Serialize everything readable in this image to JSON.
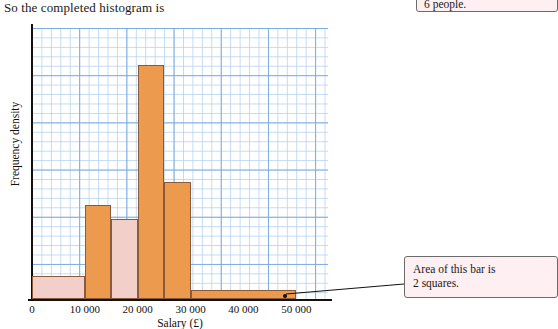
{
  "caption": "So the completed histogram is",
  "note_top": {
    "text": "6 people."
  },
  "note_area": {
    "line1": "Area of this bar is",
    "line2": "2 squares."
  },
  "chart_data": {
    "type": "bar",
    "title": "",
    "xlabel": "Salary (£)",
    "ylabel": "Frequency density",
    "xlim": [
      0,
      56000
    ],
    "ylim": [
      0,
      5.8
    ],
    "grid": true,
    "legend": null,
    "xticks": [
      "0",
      "10 000",
      "20 000",
      "30 000",
      "40 000",
      "50 000"
    ],
    "xtick_values": [
      0,
      10000,
      20000,
      30000,
      40000,
      50000
    ],
    "bars": [
      {
        "label": "0–10 000",
        "x0": 0,
        "x1": 10000,
        "height": 0.5,
        "fill": "#f2cfc8",
        "stroke": "#8a5a3a"
      },
      {
        "label": "10 000–15 000",
        "x0": 10000,
        "x1": 15000,
        "height": 2.0,
        "fill": "#eb9a4e",
        "stroke": "#8a5a3a"
      },
      {
        "label": "15 000–20 000",
        "x0": 15000,
        "x1": 20000,
        "height": 1.7,
        "fill": "#f2cfc8",
        "stroke": "#8a5a3a"
      },
      {
        "label": "20 000–25 000",
        "x0": 20000,
        "x1": 25000,
        "height": 5.0,
        "fill": "#eb9a4e",
        "stroke": "#8a5a3a"
      },
      {
        "label": "25 000–30 000",
        "x0": 25000,
        "x1": 30000,
        "height": 2.5,
        "fill": "#eb9a4e",
        "stroke": "#8a5a3a"
      },
      {
        "label": "30 000–50 000",
        "x0": 30000,
        "x1": 50000,
        "height": 0.2,
        "fill": "#eb9a4e",
        "stroke": "#8a5a3a"
      }
    ]
  }
}
